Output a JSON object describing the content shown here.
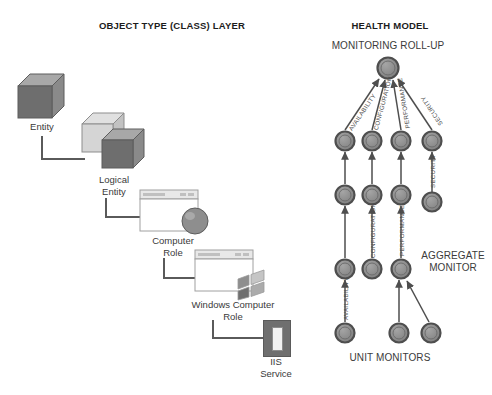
{
  "titles": {
    "left": "OBJECT TYPE (CLASS) LAYER",
    "right": "HEALTH MODEL"
  },
  "object_layer": {
    "nodes": [
      {
        "id": "entity",
        "label": "Entity",
        "icon": "cube-dark-icon"
      },
      {
        "id": "logical-entity",
        "label": "Logical\nEntity",
        "icon": "cube-pair-icon"
      },
      {
        "id": "computer-role",
        "label": "Computer\nRole",
        "icon": "window-sphere-icon"
      },
      {
        "id": "windows-computer-role",
        "label": "Windows Computer\nRole",
        "icon": "window-windows-logo-icon"
      },
      {
        "id": "iis-service",
        "label": "IIS\nService",
        "icon": "iis-service-icon"
      }
    ]
  },
  "health_model": {
    "top_label": "MONITORING ROLL-UP",
    "aggregate_label": "AGGREGATE\nMONITOR",
    "unit_label": "UNIT MONITORS",
    "rollup_edge_labels": [
      "AVAILABILITY",
      "CONFIGURATION",
      "PERFORMANCE",
      "SECURITY"
    ],
    "mid_edge_labels": [
      "SECURITY",
      "CONFIGURATION",
      "PERFORMANCE",
      "AVAILABILITY"
    ],
    "columns": [
      {
        "name": "availability",
        "label": "AVAILABILITY"
      },
      {
        "name": "configuration",
        "label": "CONFIGURATION"
      },
      {
        "name": "performance",
        "label": "PERFORMANCE"
      },
      {
        "name": "security",
        "label": "SECURITY"
      }
    ]
  },
  "colors": {
    "node_fill": "#8c8c8c",
    "node_stroke": "#4e4e4e",
    "line": "#5a5a5a",
    "text": "#3a3a3a",
    "title": "#1c1c1c",
    "cube_dark": "#6e6e6e",
    "cube_light": "#c9c9c9",
    "iis_box": "#6f6f6f"
  }
}
